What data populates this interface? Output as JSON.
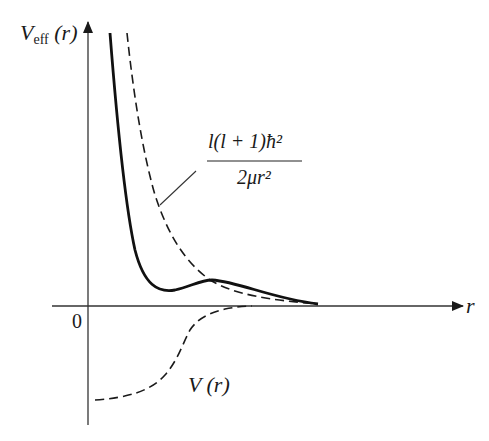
{
  "diagram": {
    "y_axis_label": {
      "main": "V",
      "subscript": "eff",
      "arg": "(r)"
    },
    "x_axis_label": "r",
    "origin_label": "0",
    "centrifugal_label": {
      "numerator": "l(l + 1)ħ²",
      "denominator": "2μr²"
    },
    "potential_label": "V (r)",
    "curves": [
      {
        "name": "effective-potential",
        "style": "solid"
      },
      {
        "name": "centrifugal-term",
        "style": "dashed"
      },
      {
        "name": "potential",
        "style": "dashed"
      }
    ]
  }
}
